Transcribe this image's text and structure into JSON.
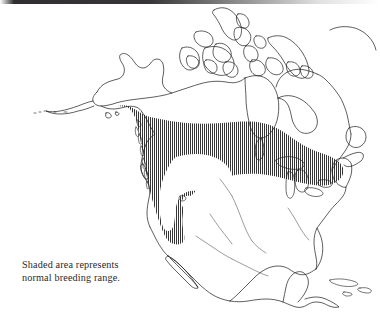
{
  "figure": {
    "kind": "range-map",
    "region": "North America",
    "background_color": "#ffffff",
    "outline_color": "#1a1a1a",
    "hatch_color": "#2b2b2b"
  },
  "caption": {
    "line1": "Shaded area represents",
    "line2": "normal breeding range.",
    "text": "Shaded area represents\nnormal breeding range.",
    "text_color": "#2a2a2c"
  },
  "legend": {
    "shaded_meaning": "normal breeding range",
    "shading_style": "vertical hatch lines"
  },
  "map_features": [
    {
      "name": "alaska",
      "label": "Alaska",
      "shaded": false
    },
    {
      "name": "aleutian-islands",
      "label": "Aleutian Islands",
      "shaded": false
    },
    {
      "name": "canadian-arctic-archipelago",
      "label": "Canadian Arctic Archipelago",
      "shaded": false
    },
    {
      "name": "baffin-island",
      "label": "Baffin Island",
      "shaded": false
    },
    {
      "name": "hudson-bay",
      "label": "Hudson Bay",
      "shaded": false
    },
    {
      "name": "greenland-edge",
      "label": "Greenland",
      "shaded": false
    },
    {
      "name": "newfoundland",
      "label": "Newfoundland",
      "shaded": true
    },
    {
      "name": "great-lakes",
      "label": "Great Lakes",
      "shaded": true
    },
    {
      "name": "baja-california",
      "label": "Baja California",
      "shaded": false
    },
    {
      "name": "gulf-of-mexico",
      "label": "Gulf of Mexico",
      "shaded": false
    },
    {
      "name": "mexico",
      "label": "Mexico",
      "shaded": false
    },
    {
      "name": "central-america",
      "label": "Central America",
      "shaded": false
    },
    {
      "name": "caribbean-islands",
      "label": "Caribbean Islands",
      "shaded": false
    },
    {
      "name": "breeding-range",
      "label": "Breeding range",
      "shaded": true
    }
  ],
  "scan_artifact": {
    "name": "top-scan-edge",
    "present": true
  }
}
